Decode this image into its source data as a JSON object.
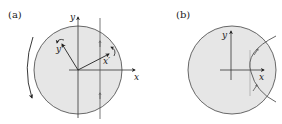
{
  "figure": {
    "panels": [
      {
        "id": "a",
        "label": "(a)",
        "axes": {
          "x_label": "x",
          "y_label": "y"
        },
        "rotated_axes": {
          "x_label": "x′",
          "y_label": "y′"
        },
        "rotation_arrow": "clockwise",
        "vertical_line_arrows": 2
      },
      {
        "id": "b",
        "label": "(b)",
        "axes": {
          "x_label": "x",
          "y_label": "y"
        },
        "arc_arrows": 2
      }
    ],
    "colors": {
      "disk_fill": "#e6e6e6",
      "stroke": "#333333",
      "line": "#555555"
    }
  }
}
